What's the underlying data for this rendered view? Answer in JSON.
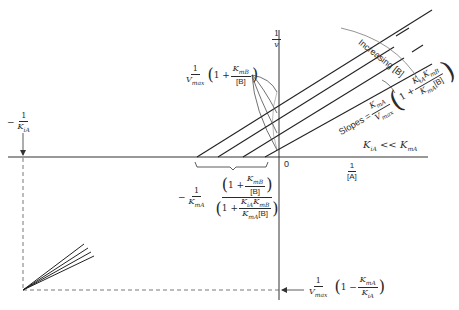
{
  "figure": {
    "type": "double-reciprocal plot (Lineweaver-Burk)",
    "y_axis_label": {
      "num": "1",
      "den": "v"
    },
    "x_axis_label": {
      "num": "1",
      "den": "[A]"
    },
    "origin_label": "0",
    "line_count": 4,
    "y_intercept_label": {
      "num": "1",
      "den": "V",
      "den_sub": "max",
      "open": "(",
      "one": "1 +",
      "frac_num": "K",
      "frac_num_sub": "mB",
      "frac_den": "[B]",
      "close": ")"
    },
    "x_intersect_label": {
      "prefix": "−",
      "num": "1",
      "den": "K",
      "den_sub": "mA",
      "top_one": "1 +",
      "top_num": "K",
      "top_num_sub": "mB",
      "top_den": "[B]",
      "bot_one": "1 +",
      "bot_num": "K",
      "bot_num_sub1": "iA",
      "bot_num2": "K",
      "bot_num_sub2": "mB",
      "bot_den": "K",
      "bot_den_sub": "mA",
      "bot_den2": "[B]"
    },
    "increasing_label": "Increasing [B]",
    "slopes_label": {
      "word": "Slopes =",
      "num": "K",
      "num_sub": "mA",
      "den": "V",
      "den_sub": "max",
      "one": "1 +",
      "inner_num": "K",
      "inner_num_sub1": "iA",
      "inner_num2": "K",
      "inner_num_sub2": "mB",
      "inner_den": "K",
      "inner_den_sub": "mA",
      "inner_den2": "[B]"
    },
    "condition_label": {
      "left": "K",
      "left_sub": "iA",
      "op": "<<",
      "right": "K",
      "right_sub": "mA"
    },
    "left_intercept_label": {
      "prefix": "−",
      "num": "1",
      "den": "K",
      "den_sub": "iA"
    },
    "bottom_intercept_label": {
      "num": "1",
      "den": "V",
      "den_sub": "max",
      "one": "1 −",
      "frac_num": "K",
      "frac_num_sub": "mA",
      "frac_den": "K",
      "frac_den_sub": "iA"
    }
  }
}
